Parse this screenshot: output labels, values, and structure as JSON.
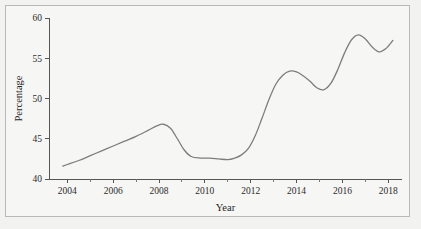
{
  "figure": {
    "background_color": "#f2f2f0",
    "panel_color": "#f6f6f4",
    "frame_color": "#b9b9b7"
  },
  "chart_data": {
    "type": "line",
    "title": "",
    "xlabel": "Year",
    "ylabel": "Percentage",
    "xlim": [
      2003.2,
      2018.6
    ],
    "ylim": [
      40,
      60
    ],
    "grid": false,
    "legend": null,
    "line_color": "#7d7d7d",
    "axis_color": "#555555",
    "xticks": [
      2004,
      2006,
      2008,
      2010,
      2012,
      2014,
      2016,
      2018
    ],
    "xtick_labels": [
      "2004",
      "2006",
      "2008",
      "2010",
      "2012",
      "2014",
      "2016",
      "2018"
    ],
    "xminor_ticks": [
      2005,
      2007,
      2009,
      2011,
      2013,
      2015,
      2017
    ],
    "yticks": [
      40,
      45,
      50,
      55,
      60
    ],
    "ytick_labels": [
      "40",
      "45",
      "50",
      "55",
      "60"
    ],
    "x": [
      2003.8,
      2004.0,
      2004.5,
      2005.0,
      2005.5,
      2006.0,
      2006.5,
      2007.0,
      2007.5,
      2007.9,
      2008.2,
      2008.5,
      2008.8,
      2009.1,
      2009.4,
      2009.8,
      2010.2,
      2010.6,
      2011.0,
      2011.3,
      2011.6,
      2011.9,
      2012.2,
      2012.5,
      2012.8,
      2013.1,
      2013.4,
      2013.7,
      2014.0,
      2014.3,
      2014.6,
      2014.9,
      2015.2,
      2015.5,
      2015.8,
      2016.1,
      2016.4,
      2016.7,
      2017.0,
      2017.3,
      2017.6,
      2017.9,
      2018.2
    ],
    "y": [
      41.6,
      41.8,
      42.3,
      42.9,
      43.5,
      44.1,
      44.7,
      45.3,
      46.0,
      46.6,
      46.8,
      46.3,
      45.0,
      43.6,
      42.8,
      42.6,
      42.6,
      42.5,
      42.4,
      42.6,
      43.0,
      43.8,
      45.4,
      47.6,
      49.9,
      51.8,
      52.9,
      53.4,
      53.3,
      52.8,
      52.1,
      51.3,
      51.1,
      51.9,
      53.6,
      55.7,
      57.3,
      57.9,
      57.4,
      56.4,
      55.8,
      56.2,
      57.2
    ],
    "series_name": "Percentage",
    "data_points_described": [
      {
        "year": 2004,
        "value": 41.8
      },
      {
        "year": 2006,
        "value": 44.1
      },
      {
        "year": 2008,
        "value": 46.8,
        "note": "local maximum"
      },
      {
        "year": 2010,
        "value": 42.6,
        "note": "trough plateau"
      },
      {
        "year": 2011,
        "value": 42.4,
        "note": "local minimum"
      },
      {
        "year": 2012,
        "value": 45.4
      },
      {
        "year": 2013.5,
        "value": 53.4,
        "note": "local maximum"
      },
      {
        "year": 2015,
        "value": 51.1,
        "note": "local minimum"
      },
      {
        "year": 2016.5,
        "value": 58.0,
        "note": "local maximum"
      },
      {
        "year": 2017.4,
        "value": 55.8,
        "note": "local minimum"
      },
      {
        "year": 2018.2,
        "value": 57.6,
        "note": "end of series"
      }
    ]
  }
}
